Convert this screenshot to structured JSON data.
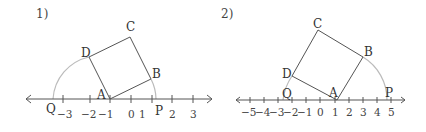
{
  "figures": [
    {
      "title": "1)",
      "points": {
        "A": "A",
        "B": "B",
        "C": "C",
        "D": "D",
        "P": "P",
        "Q": "Q"
      },
      "ticks": [
        "−3",
        "−2",
        "−1",
        "0",
        "1",
        "2",
        "3"
      ]
    },
    {
      "title": "2)",
      "points": {
        "A": "A",
        "B": "B",
        "C": "C",
        "D": "D",
        "P": "P",
        "Q": "Q"
      },
      "ticks": [
        "−5",
        "−4",
        "−3",
        "−2",
        "−1",
        "0",
        "1",
        "2",
        "3",
        "4",
        "5"
      ]
    }
  ],
  "colors": {
    "line": "#555555",
    "arc": "#bbbbbb"
  }
}
